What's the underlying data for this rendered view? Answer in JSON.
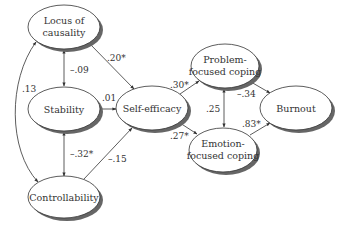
{
  "diagram": {
    "type": "path-model",
    "nodes": [
      {
        "id": "locus",
        "lines": [
          "Locus of",
          "causality"
        ]
      },
      {
        "id": "stability",
        "lines": [
          "Stability"
        ]
      },
      {
        "id": "controllability",
        "lines": [
          "Controllability"
        ]
      },
      {
        "id": "selfefficacy",
        "lines": [
          "Self-efficacy"
        ]
      },
      {
        "id": "problem",
        "lines": [
          "Problem-",
          "focused coping"
        ]
      },
      {
        "id": "emotion",
        "lines": [
          "Emotion-",
          "focused coping"
        ]
      },
      {
        "id": "burnout",
        "lines": [
          "Burnout"
        ]
      }
    ],
    "edges": [
      {
        "from": "locus",
        "to": "controllability",
        "label": ".13",
        "bidirectional": true
      },
      {
        "from": "locus",
        "to": "stability",
        "label": "–.09",
        "bidirectional": true
      },
      {
        "from": "stability",
        "to": "controllability",
        "label": "–.32*",
        "bidirectional": true
      },
      {
        "from": "locus",
        "to": "selfefficacy",
        "label": ".20*",
        "bidirectional": false
      },
      {
        "from": "stability",
        "to": "selfefficacy",
        "label": ".01",
        "bidirectional": false
      },
      {
        "from": "controllability",
        "to": "selfefficacy",
        "label": "–.15",
        "bidirectional": false
      },
      {
        "from": "selfefficacy",
        "to": "problem",
        "label": ".30*",
        "bidirectional": false
      },
      {
        "from": "selfefficacy",
        "to": "emotion",
        "label": ".27*",
        "bidirectional": false
      },
      {
        "from": "problem",
        "to": "emotion",
        "label": ".25",
        "bidirectional": true
      },
      {
        "from": "problem",
        "to": "burnout",
        "label": "–.34",
        "bidirectional": false
      },
      {
        "from": "emotion",
        "to": "burnout",
        "label": ".83*",
        "bidirectional": false
      }
    ]
  }
}
